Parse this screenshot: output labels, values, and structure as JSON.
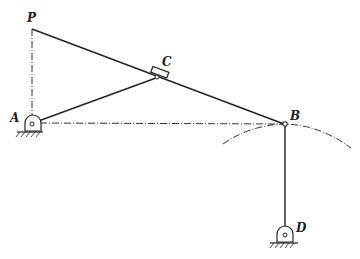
{
  "diagram": {
    "type": "linkage-mechanism",
    "labels": {
      "P": "P",
      "A": "A",
      "B": "B",
      "C": "C",
      "D": "D"
    },
    "points": {
      "P": [
        32,
        29
      ],
      "A": [
        33,
        123
      ],
      "C": [
        157,
        77
      ],
      "B": [
        285,
        124
      ],
      "D": [
        285,
        235
      ]
    },
    "links": [
      {
        "from": "P",
        "to": "B",
        "style": "solid"
      },
      {
        "from": "A",
        "to": "C",
        "style": "solid"
      },
      {
        "from": "B",
        "to": "D",
        "style": "solid"
      },
      {
        "from": "P",
        "to": "A",
        "style": "dash-dot"
      },
      {
        "from": "A",
        "to": "B",
        "style": "dash-dot"
      }
    ],
    "pivots": [
      "A",
      "D"
    ],
    "slider": "C",
    "arc": {
      "through": "B",
      "style": "dash-dot"
    },
    "colors": {
      "line": "#222222",
      "background": "#ffffff"
    }
  }
}
